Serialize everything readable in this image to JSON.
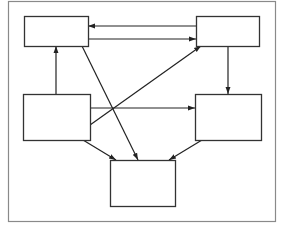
{
  "diagram": {
    "type": "directed-graph",
    "line_color": "#222222",
    "node_border_color": "#333333",
    "frame_color": "#8a8a8a",
    "nodes": [
      {
        "id": "A",
        "name": "box-top-left",
        "label": ""
      },
      {
        "id": "B",
        "name": "box-top-right",
        "label": ""
      },
      {
        "id": "C",
        "name": "box-middle-left",
        "label": ""
      },
      {
        "id": "D",
        "name": "box-middle-right",
        "label": ""
      },
      {
        "id": "E",
        "name": "box-bottom-center",
        "label": ""
      }
    ],
    "edges": [
      {
        "from": "B",
        "to": "A"
      },
      {
        "from": "A",
        "to": "B"
      },
      {
        "from": "C",
        "to": "A"
      },
      {
        "from": "A",
        "to": "E"
      },
      {
        "from": "C",
        "to": "B"
      },
      {
        "from": "C",
        "to": "D"
      },
      {
        "from": "B",
        "to": "D"
      },
      {
        "from": "C",
        "to": "E"
      },
      {
        "from": "D",
        "to": "E"
      }
    ]
  }
}
